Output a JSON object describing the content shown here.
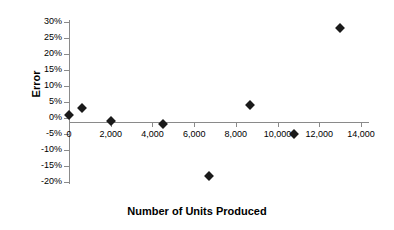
{
  "chart_data": {
    "type": "scatter",
    "title": "",
    "xlabel": "Number of Units Produced",
    "ylabel": "Error",
    "xlim": [
      0,
      14000
    ],
    "ylim": [
      -20,
      30
    ],
    "grid": false,
    "legend": null,
    "xticks": [
      {
        "value": 0,
        "label": "0"
      },
      {
        "value": 2000,
        "label": "2,000"
      },
      {
        "value": 4000,
        "label": "4,000"
      },
      {
        "value": 6000,
        "label": "6,000"
      },
      {
        "value": 8000,
        "label": "8,000"
      },
      {
        "value": 10000,
        "label": "10,000"
      },
      {
        "value": 12000,
        "label": "12,000"
      },
      {
        "value": 14000,
        "label": "14,000"
      }
    ],
    "yticks": [
      {
        "value": 30,
        "label": "30%"
      },
      {
        "value": 25,
        "label": "25%"
      },
      {
        "value": 20,
        "label": "20%"
      },
      {
        "value": 15,
        "label": "15%"
      },
      {
        "value": 10,
        "label": "10%"
      },
      {
        "value": 5,
        "label": "5%"
      },
      {
        "value": 0,
        "label": "0%"
      },
      {
        "value": -5,
        "label": "-5%"
      },
      {
        "value": -10,
        "label": "-10%"
      },
      {
        "value": -15,
        "label": "-15%"
      },
      {
        "value": -20,
        "label": "-20%"
      }
    ],
    "series": [
      {
        "name": "Error",
        "marker": "diamond",
        "color": "#1a1a1a",
        "points": [
          {
            "x": 0,
            "y": 1
          },
          {
            "x": 600,
            "y": 3
          },
          {
            "x": 2000,
            "y": -1
          },
          {
            "x": 4500,
            "y": -2
          },
          {
            "x": 6700,
            "y": -18
          },
          {
            "x": 8700,
            "y": 4
          },
          {
            "x": 10800,
            "y": -5
          },
          {
            "x": 13000,
            "y": 28
          }
        ]
      }
    ]
  }
}
